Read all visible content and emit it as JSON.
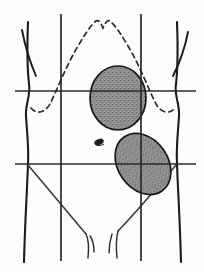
{
  "figure": {
    "background_color": "#fdfdfd",
    "ink_color": "#1b1b1b",
    "mass_fill_color": "#8f8f8f",
    "width": 204,
    "height": 272
  },
  "body": {
    "left_flank_label": "left torso outline",
    "right_flank_label": "right torso outline",
    "left_arm_label": "left arm inner contour",
    "right_arm_label": "right arm inner contour"
  },
  "grid": {
    "vertical_lines": [
      {
        "name": "left-midclavicular-line",
        "x": 61,
        "y_top": 14,
        "y_bottom": 261
      },
      {
        "name": "right-midclavicular-line",
        "x": 141,
        "y_top": 14,
        "y_bottom": 261
      }
    ],
    "horizontal_lines": [
      {
        "name": "subcostal-plane",
        "y": 91,
        "x_left": 15,
        "x_right": 196
      },
      {
        "name": "transtubercular-plane",
        "y": 164,
        "x_left": 15,
        "x_right": 196
      }
    ]
  },
  "costal_margin": {
    "name": "costal-margin",
    "style": "dashed",
    "description": "dashed rib margin with xiphoid notch at apex"
  },
  "masses": [
    {
      "name": "upper-mass",
      "shape": "ellipse",
      "cx": 118,
      "cy": 98,
      "rx": 28,
      "ry": 32,
      "rotation": 0,
      "fill": "#8f8f8f"
    },
    {
      "name": "lower-mass",
      "shape": "ellipse",
      "cx": 143,
      "cy": 164,
      "rx": 25,
      "ry": 33,
      "rotation": -35,
      "fill": "#8f8f8f"
    }
  ],
  "landmarks": [
    {
      "name": "umbilicus",
      "cx": 99,
      "cy": 142
    },
    {
      "name": "left-inguinal-ligament"
    },
    {
      "name": "right-inguinal-ligament"
    }
  ]
}
